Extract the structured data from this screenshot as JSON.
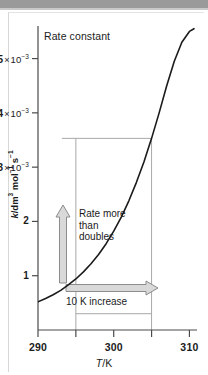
{
  "figure": {
    "background_color": "#ffffff",
    "band_color": "#9a9a9a",
    "border_color": "#d8d8d8",
    "curve_color": "#1b1b1b",
    "arrow_fill": "#d9d9d9",
    "arrow_stroke": "#8c8c8c",
    "guide_color": "#a8a8a8"
  },
  "chart_data": {
    "type": "line",
    "title": "Rate constant",
    "xlabel": "T/K",
    "ylabel": "k/dm3 mol-1 s-1",
    "ylabel_parts": {
      "k": "k",
      "slash_dm": "/dm",
      "dm_sup": "3",
      "mol": " mol",
      "mol_sup": "−1",
      "s": " s",
      "s_sup": "−1"
    },
    "xlim": [
      290,
      311
    ],
    "ylim": [
      0,
      5.6
    ],
    "grid": false,
    "legend": null,
    "xticks": [
      {
        "value": 290,
        "label": "290",
        "major": true
      },
      {
        "value": 295,
        "label": "",
        "major": false
      },
      {
        "value": 300,
        "label": "300",
        "major": true
      },
      {
        "value": 305,
        "label": "",
        "major": false
      },
      {
        "value": 310,
        "label": "310",
        "major": true
      }
    ],
    "yticks": [
      {
        "value": 1,
        "mantissa": "1",
        "times": "",
        "base": "",
        "exponent": "",
        "label": "1"
      },
      {
        "value": 2,
        "mantissa": "2",
        "times": "",
        "base": "",
        "exponent": "",
        "label": "2"
      },
      {
        "value": 3,
        "mantissa": "3",
        "times": "×",
        "base": "10",
        "exponent": "−3",
        "label": "3 × 10−3"
      },
      {
        "value": 4,
        "mantissa": "4",
        "times": "×",
        "base": "10",
        "exponent": "−3",
        "label": "4 × 10−3"
      },
      {
        "value": 5,
        "mantissa": "5",
        "times": "×",
        "base": "10",
        "exponent": "−3",
        "label": "5 × 10−3"
      }
    ],
    "series": [
      {
        "name": "rate constant",
        "x": [
          290,
          291,
          292,
          293,
          294,
          295,
          296,
          297,
          298,
          299,
          300,
          301,
          302,
          303,
          304,
          305,
          306,
          307,
          308,
          309,
          310,
          310.6
        ],
        "values": [
          0.52,
          0.58,
          0.65,
          0.73,
          0.83,
          0.94,
          1.07,
          1.22,
          1.39,
          1.59,
          1.82,
          2.08,
          2.38,
          2.72,
          3.1,
          3.53,
          4.0,
          4.5,
          4.95,
          5.3,
          5.5,
          5.55
        ]
      }
    ],
    "annotations": [
      {
        "name": "rate-doubles-note",
        "text_lines": [
          "Rate more",
          "than",
          "doubles"
        ],
        "arrow": "up",
        "from_value": 0.94,
        "to_value": 3.53
      },
      {
        "name": "ten-k-increase-note",
        "text_lines": [
          "10 K increase"
        ],
        "arrow": "right",
        "from_value": 295,
        "to_value": 305
      }
    ],
    "guide_box": {
      "x_start": 295,
      "x_end": 305,
      "y_top": 3.53,
      "y_bottom": 0
    }
  }
}
